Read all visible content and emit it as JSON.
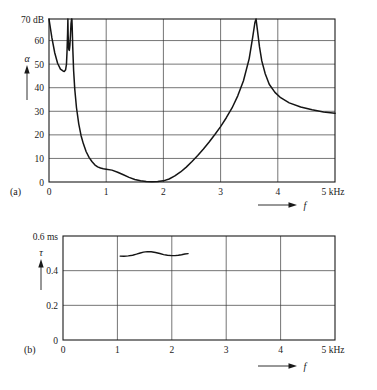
{
  "figure": {
    "background_color": "#ffffff",
    "line_color": "#151515",
    "grid_color": "#3a3a3a"
  },
  "panels": [
    {
      "id": "a",
      "label": "(a)",
      "y_symbol": "α",
      "y_unit": "dB",
      "y_top_label": "70 dB",
      "x_symbol": "f",
      "x_unit": "kHz",
      "x_end_label": "5 kHz",
      "y_ticks": [
        "0",
        "10",
        "20",
        "30",
        "40",
        "50",
        "60",
        "70"
      ],
      "x_ticks": [
        "0",
        "1",
        "2",
        "3",
        "4",
        "5"
      ]
    },
    {
      "id": "b",
      "label": "(b)",
      "y_symbol": "τ",
      "y_unit": "ms",
      "y_top_label": "0.6 ms",
      "x_symbol": "f",
      "x_unit": "kHz",
      "x_end_label": "5 kHz",
      "y_ticks": [
        "0",
        "0.2",
        "0.4",
        "0.6"
      ],
      "x_ticks": [
        "0",
        "1",
        "2",
        "3",
        "4",
        "5"
      ]
    }
  ],
  "chart_data": [
    {
      "type": "line",
      "title": "",
      "panel": "(a)",
      "xlabel": "f",
      "x_unit": "kHz",
      "ylabel": "α",
      "y_unit": "dB",
      "xlim": [
        0,
        5
      ],
      "ylim": [
        0,
        70
      ],
      "xticks": [
        0,
        1,
        2,
        3,
        4,
        5
      ],
      "yticks": [
        0,
        10,
        20,
        30,
        40,
        50,
        60,
        70
      ],
      "grid": true,
      "legend": "none",
      "annotations": [
        "attenuation falls from 70 dB at 0 kHz to a shallow minimum near 0 dB between 1.6 and 2.0 kHz",
        "two narrow resonance spikes to 70 dB near 0.33 and 0.40 kHz",
        "pole (resonance) at about 3.62 kHz reaching 70 dB",
        "asymptote near 29-30 dB toward 5 kHz"
      ],
      "series": [
        {
          "name": "attenuation",
          "x": [
            0.0,
            0.05,
            0.1,
            0.15,
            0.2,
            0.25,
            0.27,
            0.29,
            0.305,
            0.315,
            0.325,
            0.33,
            0.335,
            0.345,
            0.355,
            0.365,
            0.375,
            0.385,
            0.395,
            0.4,
            0.405,
            0.415,
            0.43,
            0.45,
            0.48,
            0.52,
            0.56,
            0.6,
            0.65,
            0.7,
            0.75,
            0.8,
            0.85,
            0.9,
            0.95,
            1.0,
            1.1,
            1.2,
            1.3,
            1.4,
            1.5,
            1.6,
            1.7,
            1.8,
            1.9,
            2.0,
            2.1,
            2.2,
            2.3,
            2.4,
            2.5,
            2.6,
            2.7,
            2.8,
            2.9,
            3.0,
            3.1,
            3.2,
            3.3,
            3.4,
            3.5,
            3.56,
            3.6,
            3.62,
            3.64,
            3.68,
            3.72,
            3.78,
            3.85,
            3.95,
            4.05,
            4.2,
            4.4,
            4.6,
            4.8,
            5.0
          ],
          "y": [
            70.0,
            62.0,
            55.5,
            51.0,
            48.5,
            47.6,
            47.5,
            48.2,
            50.5,
            56.0,
            64.0,
            70.0,
            63.0,
            57.0,
            56.5,
            58.5,
            63.0,
            68.0,
            70.0,
            70.0,
            67.0,
            58.0,
            48.0,
            40.0,
            32.0,
            25.0,
            20.0,
            16.5,
            13.0,
            10.6,
            8.8,
            7.4,
            6.5,
            6.0,
            5.7,
            5.5,
            5.1,
            4.2,
            3.1,
            2.0,
            1.1,
            0.5,
            0.2,
            0.1,
            0.2,
            0.5,
            1.3,
            2.6,
            4.3,
            6.4,
            8.8,
            11.4,
            14.2,
            17.2,
            20.4,
            23.8,
            27.6,
            31.8,
            37.0,
            43.5,
            53.0,
            62.0,
            68.5,
            70.0,
            66.0,
            58.0,
            52.0,
            46.5,
            42.0,
            38.5,
            36.2,
            34.0,
            32.2,
            31.0,
            30.1,
            29.5
          ]
        }
      ]
    },
    {
      "type": "line",
      "title": "",
      "panel": "(b)",
      "xlabel": "f",
      "x_unit": "kHz",
      "ylabel": "τ",
      "y_unit": "ms",
      "xlim": [
        0,
        5
      ],
      "ylim": [
        0,
        0.6
      ],
      "xticks": [
        0,
        1,
        2,
        3,
        4,
        5
      ],
      "yticks": [
        0,
        0.2,
        0.4,
        0.6
      ],
      "grid": true,
      "legend": "none",
      "annotations": [
        "group delay plotted only over the passband from about 1.05 to 2.30 kHz",
        "gently rippling around 0.49 ms with a maximum near 0.51 ms at 1.55 kHz"
      ],
      "series": [
        {
          "name": "group-delay",
          "x": [
            1.05,
            1.12,
            1.2,
            1.28,
            1.35,
            1.42,
            1.48,
            1.55,
            1.62,
            1.7,
            1.78,
            1.85,
            1.92,
            2.0,
            2.06,
            2.12,
            2.18,
            2.24,
            2.3
          ],
          "y": [
            0.484,
            0.483,
            0.485,
            0.489,
            0.495,
            0.502,
            0.507,
            0.51,
            0.509,
            0.505,
            0.499,
            0.493,
            0.489,
            0.487,
            0.487,
            0.489,
            0.492,
            0.496,
            0.498
          ]
        }
      ]
    }
  ]
}
